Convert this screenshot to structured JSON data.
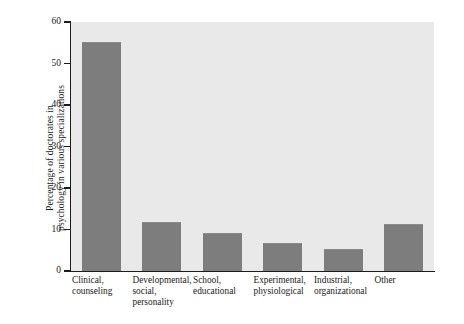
{
  "chart_data": {
    "type": "bar",
    "title": "",
    "subtitle": "",
    "xlabel": "",
    "ylabel": "Percentage of doctorates in psychology in various specializations",
    "ylabel_line1": "Percentage of doctorates in",
    "ylabel_line2": "psychology in various specializations",
    "categories": [
      "Clinical, counseling",
      "Developmental, social, personality",
      "School, educational",
      "Experimental, physiological",
      "Industrial, organizational",
      "Other"
    ],
    "category_lines": [
      [
        "Clinical,",
        "counseling"
      ],
      [
        "Developmental,",
        "social,",
        "personality"
      ],
      [
        "School,",
        "educational"
      ],
      [
        "Experimental,",
        "physiological"
      ],
      [
        "Industrial,",
        "organizational"
      ],
      [
        "Other"
      ]
    ],
    "values": [
      55,
      11.5,
      9,
      6.5,
      5,
      11
    ],
    "ylim": [
      0,
      60
    ],
    "yticks": [
      0,
      10,
      20,
      30,
      40,
      50,
      60
    ],
    "ytick_labels": [
      "0",
      "10",
      "20",
      "30",
      "40",
      "50",
      "60"
    ],
    "grid": false,
    "legend": "none",
    "colors": {
      "bar_fill": "#7d7d7d",
      "plot_background": "#e9e9e9",
      "axis": "#1c1c1c",
      "text": "#1a1a1a",
      "figure_background": "#ffffff"
    }
  }
}
